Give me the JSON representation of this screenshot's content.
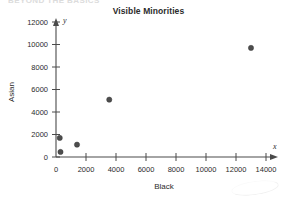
{
  "header": {
    "clipped_text": "BEYOND THE BASICS"
  },
  "chart_data": {
    "type": "scatter",
    "title": "Visible Minorities",
    "xlabel": "Black",
    "ylabel": "Asian",
    "x_axis_symbol": "x",
    "y_axis_symbol": "y",
    "grid": false,
    "legend": "none",
    "xlim": [
      0,
      14000
    ],
    "ylim": [
      0,
      12000
    ],
    "xticks": [
      0,
      2000,
      4000,
      6000,
      8000,
      10000,
      12000,
      14000
    ],
    "yticks": [
      0,
      2000,
      4000,
      6000,
      8000,
      10000,
      12000
    ],
    "xtick_labels": [
      "0",
      "2000",
      "4000",
      "6000",
      "8000",
      "10000",
      "12000",
      "14000"
    ],
    "ytick_labels": [
      "0",
      "2000",
      "4000",
      "6000",
      "8000",
      "10000",
      "12000"
    ],
    "marker_color": "#4d4d4d",
    "points": [
      {
        "x": 250,
        "y": 1700
      },
      {
        "x": 300,
        "y": 450
      },
      {
        "x": 1400,
        "y": 1100
      },
      {
        "x": 3550,
        "y": 5100
      },
      {
        "x": 13000,
        "y": 9700
      }
    ]
  }
}
